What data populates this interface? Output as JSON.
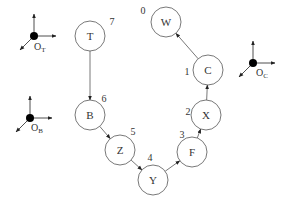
{
  "diagram": {
    "colors": {
      "stroke": "#555555",
      "text": "#333333",
      "frame_dot": "#000000",
      "background": "#ffffff"
    },
    "nodes": [
      {
        "id": "T",
        "label": "T",
        "order": "7",
        "cx": 90,
        "cy": 36,
        "r": 15,
        "ox": 112,
        "oy": 25
      },
      {
        "id": "B",
        "label": "B",
        "order": "6",
        "cx": 90,
        "cy": 115,
        "r": 15,
        "ox": 104,
        "oy": 102
      },
      {
        "id": "Z",
        "label": "Z",
        "order": "5",
        "cx": 120,
        "cy": 150,
        "r": 15,
        "ox": 133,
        "oy": 135
      },
      {
        "id": "Y",
        "label": "Y",
        "order": "4",
        "cx": 153,
        "cy": 180,
        "r": 15,
        "ox": 150,
        "oy": 161
      },
      {
        "id": "F",
        "label": "F",
        "order": "3",
        "cx": 192,
        "cy": 152,
        "r": 15,
        "ox": 182,
        "oy": 138
      },
      {
        "id": "X",
        "label": "X",
        "order": "2",
        "cx": 206,
        "cy": 115,
        "r": 15,
        "ox": 188,
        "oy": 115
      },
      {
        "id": "C",
        "label": "C",
        "order": "1",
        "cx": 208,
        "cy": 70,
        "r": 15,
        "ox": 187,
        "oy": 75
      },
      {
        "id": "W",
        "label": "W",
        "order": "0",
        "cx": 166,
        "cy": 22,
        "r": 15,
        "ox": 143,
        "oy": 14
      }
    ],
    "edges": [
      {
        "from": "T",
        "to": "B"
      },
      {
        "from": "B",
        "to": "Z"
      },
      {
        "from": "Z",
        "to": "Y"
      },
      {
        "from": "Y",
        "to": "F"
      },
      {
        "from": "F",
        "to": "X"
      },
      {
        "from": "X",
        "to": "C"
      },
      {
        "from": "C",
        "to": "W"
      }
    ],
    "frames": [
      {
        "id": "OT",
        "label": "O",
        "sub": "T",
        "x": 34,
        "y": 36,
        "lx": 34,
        "ly": 50
      },
      {
        "id": "OB",
        "label": "O",
        "sub": "B",
        "x": 30,
        "y": 118,
        "lx": 31,
        "ly": 131
      },
      {
        "id": "OC",
        "label": "O",
        "sub": "C",
        "x": 253,
        "y": 63,
        "lx": 256,
        "ly": 76
      }
    ]
  }
}
